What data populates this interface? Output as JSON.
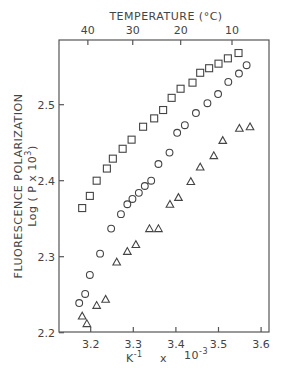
{
  "chart_data": {
    "type": "scatter",
    "title": "",
    "xlabel": "K^-1 x 10^-3",
    "xlabel_parts": {
      "unit": "K",
      "unit_exp": "-1",
      "times": "x",
      "base": "10",
      "base_exp": "-3"
    },
    "ylabel": "FLUORESCENCE POLARIZATION Log ( P x 10^3 )",
    "ylabel_parts": {
      "line1": "FLUORESCENCE  POLARIZATION",
      "line2": "Log ( P x 10",
      "line2_exp": "3",
      "line2_end": ")"
    },
    "top_axis_label": "TEMPERATURE (°C)",
    "xlim": [
      3.13,
      3.62
    ],
    "ylim": [
      2.2,
      2.584
    ],
    "x_ticks": [
      3.2,
      3.3,
      3.4,
      3.5,
      3.6
    ],
    "x_tick_labels": [
      "3.2",
      "3.3",
      "3.4",
      "3.5",
      "3.6"
    ],
    "y_ticks": [
      2.2,
      2.3,
      2.4,
      2.5
    ],
    "y_tick_labels": [
      "2.2",
      "2.3",
      "2.4",
      "2.5"
    ],
    "top_ticks_celsius": [
      40,
      30,
      20,
      10
    ],
    "top_tick_labels": [
      "40",
      "30",
      "20",
      "10"
    ],
    "grid": false,
    "legend": null,
    "series": [
      {
        "name": "squares",
        "marker": "square",
        "points": [
          [
            3.18,
            2.364
          ],
          [
            3.198,
            2.38
          ],
          [
            3.214,
            2.4
          ],
          [
            3.238,
            2.416
          ],
          [
            3.252,
            2.429
          ],
          [
            3.275,
            2.442
          ],
          [
            3.296,
            2.454
          ],
          [
            3.323,
            2.471
          ],
          [
            3.349,
            2.482
          ],
          [
            3.37,
            2.493
          ],
          [
            3.39,
            2.509
          ],
          [
            3.411,
            2.521
          ],
          [
            3.439,
            2.529
          ],
          [
            3.457,
            2.542
          ],
          [
            3.478,
            2.548
          ],
          [
            3.5,
            2.554
          ],
          [
            3.522,
            2.561
          ],
          [
            3.547,
            2.568
          ]
        ]
      },
      {
        "name": "circles",
        "marker": "circle",
        "points": [
          [
            3.173,
            2.239
          ],
          [
            3.187,
            2.251
          ],
          [
            3.198,
            2.276
          ],
          [
            3.222,
            2.304
          ],
          [
            3.248,
            2.337
          ],
          [
            3.271,
            2.356
          ],
          [
            3.286,
            2.369
          ],
          [
            3.298,
            2.376
          ],
          [
            3.313,
            2.384
          ],
          [
            3.327,
            2.393
          ],
          [
            3.342,
            2.4
          ],
          [
            3.359,
            2.422
          ],
          [
            3.385,
            2.437
          ],
          [
            3.403,
            2.463
          ],
          [
            3.421,
            2.473
          ],
          [
            3.447,
            2.489
          ],
          [
            3.474,
            2.502
          ],
          [
            3.499,
            2.514
          ],
          [
            3.523,
            2.53
          ],
          [
            3.548,
            2.541
          ],
          [
            3.566,
            2.552
          ]
        ]
      },
      {
        "name": "triangles",
        "marker": "triangle",
        "points": [
          [
            3.18,
            2.222
          ],
          [
            3.191,
            2.212
          ],
          [
            3.214,
            2.236
          ],
          [
            3.235,
            2.244
          ],
          [
            3.261,
            2.293
          ],
          [
            3.286,
            2.307
          ],
          [
            3.306,
            2.316
          ],
          [
            3.338,
            2.337
          ],
          [
            3.359,
            2.337
          ],
          [
            3.386,
            2.369
          ],
          [
            3.406,
            2.378
          ],
          [
            3.435,
            2.399
          ],
          [
            3.457,
            2.418
          ],
          [
            3.489,
            2.433
          ],
          [
            3.51,
            2.453
          ],
          [
            3.549,
            2.469
          ],
          [
            3.574,
            2.471
          ]
        ]
      }
    ]
  }
}
